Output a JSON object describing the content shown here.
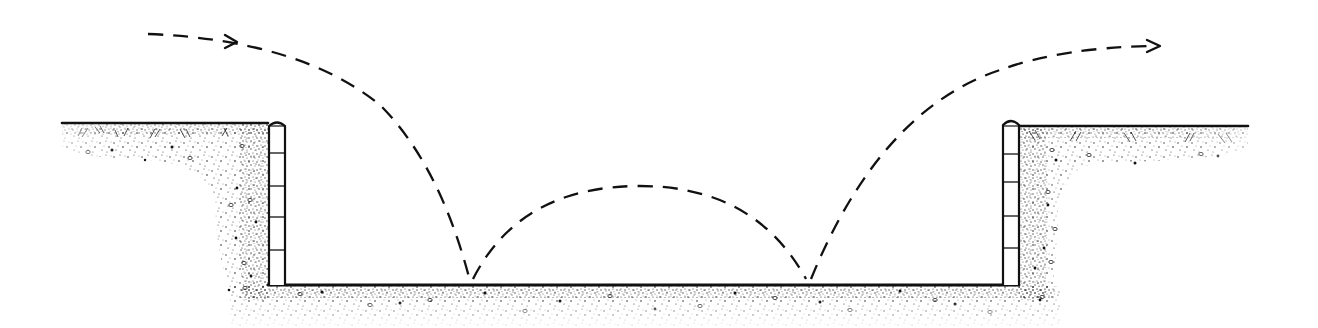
{
  "diagram": {
    "kind": "cross-section",
    "colors": {
      "background": "#ffffff",
      "ink": "#111111",
      "soil": "#222222"
    },
    "ground": {
      "left_surface": {
        "x1": 62,
        "x2": 268,
        "y": 123
      },
      "right_surface": {
        "x1": 1019,
        "x2": 1248,
        "y": 126
      },
      "pit_floor": {
        "x1": 285,
        "x2": 1002,
        "y": 285
      }
    },
    "walls": [
      {
        "name": "left-wall",
        "x": 269,
        "y_top": 122,
        "y_bottom": 285,
        "width": 16,
        "courses": 5
      },
      {
        "name": "right-wall",
        "x": 1003,
        "y_top": 120,
        "y_bottom": 285,
        "width": 16,
        "courses": 5
      }
    ],
    "trajectory": {
      "style": "dashed",
      "start": [
        148,
        34
      ],
      "bounce_points": [
        [
          470,
          281
        ],
        [
          808,
          281
        ]
      ],
      "middle_apex": [
        640,
        186
      ],
      "end": [
        1160,
        46
      ],
      "arrows": [
        {
          "name": "entry-arrow",
          "at": [
            236,
            43
          ],
          "direction": "right"
        },
        {
          "name": "exit-arrow",
          "at": [
            1160,
            46
          ],
          "direction": "right"
        }
      ]
    }
  }
}
